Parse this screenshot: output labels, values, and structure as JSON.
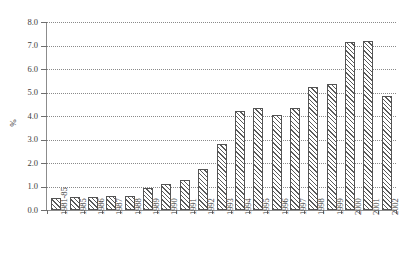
{
  "chart_data": {
    "type": "bar",
    "title": "",
    "subtitle": "",
    "xlabel": "",
    "ylabel": "%",
    "ylim": [
      0.0,
      8.0
    ],
    "ytick_step": 1.0,
    "yticks": [
      "8.0",
      "7.0",
      "6.0",
      "5.0",
      "4.0",
      "3.0",
      "2.0",
      "1.0",
      "0.0"
    ],
    "ytick_values": [
      8.0,
      7.0,
      6.0,
      5.0,
      4.0,
      3.0,
      2.0,
      1.0,
      0.0
    ],
    "grid": true,
    "grid_axis": "y",
    "grid_style": "dotted",
    "legend": false,
    "legend_position": "none",
    "bar_fill": "diagonal-hatch",
    "categories": [
      "1981-85",
      "1985",
      "1986",
      "1987",
      "1988",
      "1989",
      "1990",
      "1991",
      "1992",
      "1993",
      "1994",
      "1995",
      "1996",
      "1997",
      "1998",
      "1999",
      "2000",
      "2001",
      "2002"
    ],
    "values": [
      0.5,
      0.55,
      0.55,
      0.6,
      0.58,
      0.92,
      1.1,
      1.27,
      1.75,
      2.8,
      4.2,
      4.35,
      4.05,
      4.35,
      5.25,
      5.35,
      7.15,
      7.2,
      4.85
    ],
    "series": [
      {
        "name": "",
        "values": [
          0.5,
          0.55,
          0.55,
          0.6,
          0.58,
          0.92,
          1.1,
          1.27,
          1.75,
          2.8,
          4.2,
          4.35,
          4.05,
          4.35,
          5.25,
          5.35,
          7.15,
          7.2,
          4.85
        ]
      }
    ],
    "colors": {
      "bar_edge": "#545454",
      "bar_hatch": "#5a5a5a",
      "background": "#ffffff",
      "grid": "#8a8a8a",
      "axis": "#8c8c8c",
      "text": "#3c3c3c"
    }
  }
}
